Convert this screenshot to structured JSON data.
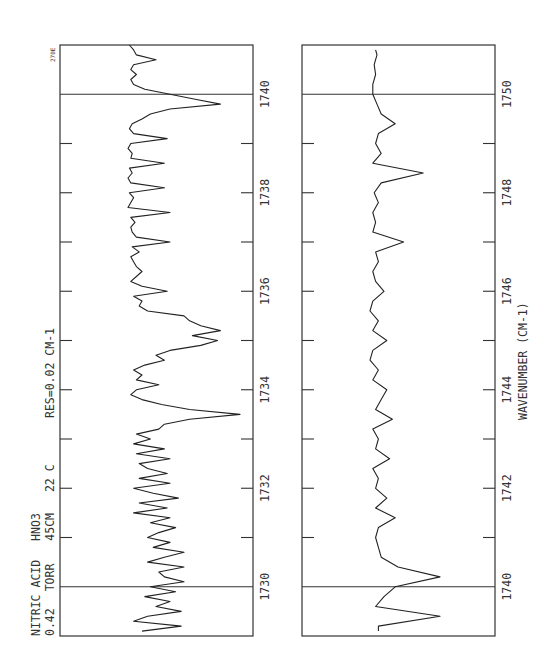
{
  "figure": {
    "corner_label": "270E",
    "info_lines": [
      "NITRIC ACID  HNO3",
      "0.42  TORR   45CM   22 C"
    ],
    "info_line1_parts": [
      "NITRIC ACID",
      "HNO3"
    ],
    "info_line2_parts": [
      "0.42",
      "TORR",
      "45CM",
      "22 C"
    ],
    "resolution_label": "RES=0.02 CM-1",
    "xlabel": "WAVENUMBER (CM-1)"
  },
  "colors": {
    "ink": "#222222",
    "frame": "#333333",
    "background": "#ffffff"
  },
  "chart_data": [
    {
      "type": "line",
      "title": "NITRIC ACID HNO3 — 0.42 TORR, 45CM, 22 C (RES=0.02 CM-1)",
      "orientation": "rotated 90° (wavenumber runs vertically, decreasing downward)",
      "xlabel": "WAVENUMBER (CM-1)",
      "ylabel": "",
      "xlim": [
        1729.0,
        1741.0
      ],
      "tick_labels": [
        "1730",
        "1732",
        "1734",
        "1736",
        "1738",
        "1740"
      ],
      "ticks": [
        1730,
        1731,
        1732,
        1733,
        1734,
        1735,
        1736,
        1737,
        1738,
        1739,
        1740
      ],
      "reference_lines": [
        1730,
        1740
      ],
      "grid": false,
      "series": [
        {
          "name": "HNO3 absorbance (relative, 0=baseline)",
          "x": [
            1741.0,
            1740.9,
            1740.8,
            1740.7,
            1740.6,
            1740.5,
            1740.4,
            1740.3,
            1740.2,
            1740.1,
            1740.0,
            1739.9,
            1739.8,
            1739.7,
            1739.6,
            1739.5,
            1739.4,
            1739.3,
            1739.2,
            1739.1,
            1739.0,
            1738.9,
            1738.8,
            1738.7,
            1738.6,
            1738.5,
            1738.4,
            1738.3,
            1738.2,
            1738.1,
            1738.0,
            1737.9,
            1737.8,
            1737.7,
            1737.6,
            1737.5,
            1737.4,
            1737.3,
            1737.2,
            1737.1,
            1737.0,
            1736.9,
            1736.8,
            1736.7,
            1736.6,
            1736.5,
            1736.4,
            1736.3,
            1736.2,
            1736.1,
            1736.0,
            1735.9,
            1735.8,
            1735.7,
            1735.6,
            1735.5,
            1735.4,
            1735.3,
            1735.2,
            1735.1,
            1735.0,
            1734.9,
            1734.8,
            1734.7,
            1734.6,
            1734.5,
            1734.4,
            1734.3,
            1734.2,
            1734.1,
            1734.0,
            1733.9,
            1733.8,
            1733.7,
            1733.6,
            1733.5,
            1733.4,
            1733.3,
            1733.2,
            1733.1,
            1733.0,
            1732.9,
            1732.8,
            1732.7,
            1732.6,
            1732.5,
            1732.4,
            1732.3,
            1732.2,
            1732.1,
            1732.0,
            1731.9,
            1731.8,
            1731.7,
            1731.6,
            1731.5,
            1731.4,
            1731.3,
            1731.2,
            1731.1,
            1731.0,
            1730.9,
            1730.8,
            1730.7,
            1730.6,
            1730.5,
            1730.4,
            1730.3,
            1730.2,
            1730.1,
            1730.0,
            1729.9,
            1729.8,
            1729.7,
            1729.6,
            1729.5,
            1729.4,
            1729.3,
            1729.2,
            1729.1
          ],
          "values": [
            1,
            4,
            6,
            20,
            4,
            2,
            6,
            2,
            4,
            12,
            30,
            48,
            66,
            30,
            16,
            10,
            3,
            1,
            4,
            28,
            2,
            0,
            3,
            2,
            26,
            1,
            3,
            0,
            2,
            26,
            1,
            4,
            2,
            0,
            30,
            2,
            5,
            2,
            3,
            6,
            30,
            3,
            8,
            2,
            4,
            6,
            10,
            6,
            2,
            10,
            28,
            4,
            10,
            8,
            14,
            40,
            44,
            52,
            66,
            46,
            64,
            52,
            30,
            20,
            26,
            12,
            4,
            10,
            6,
            22,
            6,
            2,
            10,
            24,
            44,
            80,
            44,
            26,
            22,
            6,
            16,
            4,
            26,
            6,
            30,
            8,
            14,
            28,
            8,
            30,
            4,
            18,
            36,
            8,
            28,
            4,
            30,
            16,
            34,
            22,
            14,
            30,
            18,
            40,
            26,
            14,
            40,
            22,
            26,
            40,
            16,
            34,
            12,
            30,
            20,
            38,
            14,
            4,
            38,
            10
          ]
        }
      ]
    },
    {
      "type": "line",
      "title": "NITRIC ACID HNO3 — 0.42 TORR, 45CM, 22 C (RES=0.02 CM-1)",
      "orientation": "rotated 90° (wavenumber runs vertically, decreasing downward)",
      "xlabel": "WAVENUMBER (CM-1)",
      "ylabel": "",
      "xlim": [
        1739.0,
        1751.0
      ],
      "tick_labels": [
        "1740",
        "1742",
        "1744",
        "1746",
        "1748",
        "1750"
      ],
      "ticks": [
        1740,
        1741,
        1742,
        1743,
        1744,
        1745,
        1746,
        1747,
        1748,
        1749,
        1750
      ],
      "reference_lines": [
        1740,
        1750
      ],
      "grid": false,
      "series": [
        {
          "name": "HNO3 absorbance (relative, 0=baseline)",
          "x": [
            1750.9,
            1750.8,
            1750.6,
            1750.4,
            1750.2,
            1750.0,
            1749.8,
            1749.6,
            1749.4,
            1749.2,
            1749.0,
            1748.8,
            1748.6,
            1748.4,
            1748.2,
            1748.0,
            1747.8,
            1747.6,
            1747.4,
            1747.2,
            1747.0,
            1746.8,
            1746.6,
            1746.4,
            1746.2,
            1746.0,
            1745.8,
            1745.6,
            1745.4,
            1745.2,
            1745.0,
            1744.8,
            1744.6,
            1744.4,
            1744.2,
            1744.0,
            1743.8,
            1743.6,
            1743.4,
            1743.2,
            1743.0,
            1742.8,
            1742.6,
            1742.4,
            1742.2,
            1742.0,
            1741.8,
            1741.6,
            1741.4,
            1741.2,
            1741.0,
            1740.8,
            1740.6,
            1740.4,
            1740.2,
            1740.0,
            1739.8,
            1739.6,
            1739.4,
            1739.2,
            1739.1
          ],
          "values": [
            4,
            5,
            3,
            4,
            2,
            2,
            5,
            8,
            18,
            6,
            4,
            8,
            2,
            38,
            8,
            3,
            6,
            2,
            4,
            2,
            24,
            4,
            6,
            2,
            4,
            10,
            2,
            0,
            6,
            2,
            12,
            2,
            0,
            6,
            2,
            12,
            8,
            4,
            16,
            2,
            6,
            4,
            14,
            2,
            6,
            4,
            12,
            4,
            18,
            6,
            4,
            6,
            8,
            20,
            50,
            18,
            10,
            4,
            50,
            6,
            6
          ]
        }
      ]
    }
  ]
}
